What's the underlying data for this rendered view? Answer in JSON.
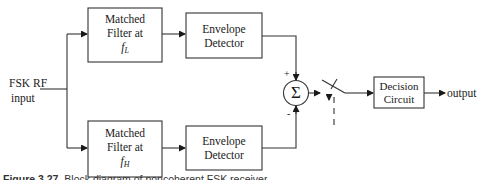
{
  "diagram": {
    "input_label_line1": "FSK RF",
    "input_label_line2": "input",
    "top_branch": {
      "matched_filter": {
        "line1": "Matched",
        "line2": "Filter at",
        "freq_symbol": "f",
        "freq_subscript": "L"
      },
      "envelope_detector": {
        "line1": "Envelope",
        "line2": "Detector"
      },
      "summer_sign": "+"
    },
    "bottom_branch": {
      "matched_filter": {
        "line1": "Matched",
        "line2": "Filter at",
        "freq_symbol": "f",
        "freq_subscript": "H"
      },
      "envelope_detector": {
        "line1": "Envelope",
        "line2": "Detector"
      },
      "summer_sign": "-"
    },
    "summer_symbol": "Σ",
    "decision_circuit": {
      "line1": "Decision",
      "line2": "Circuit"
    },
    "output_label": "output",
    "caption": {
      "label": "Figure 3.27",
      "text": "Block diagram of noncoherent FSK receiver"
    }
  }
}
